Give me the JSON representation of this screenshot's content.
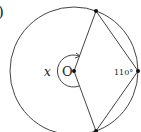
{
  "figure": {
    "part_label": ")",
    "center_label": "O",
    "reflex_angle_label": "x",
    "inscribed_angle_label": "110°",
    "colors": {
      "stroke": "#333333",
      "text": "#222222",
      "background": "#ffffff"
    }
  }
}
